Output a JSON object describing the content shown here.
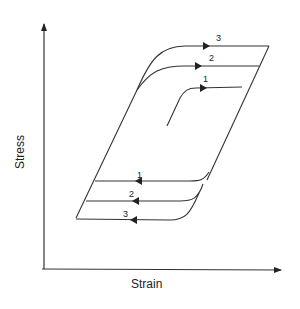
{
  "diagram": {
    "title": "",
    "x_axis_label": "Strain",
    "y_axis_label": "Stress",
    "upper_loop_labels": [
      "1",
      "2",
      "3"
    ],
    "lower_loop_labels": [
      "1",
      "2",
      "3"
    ],
    "line_color": "#333333"
  }
}
